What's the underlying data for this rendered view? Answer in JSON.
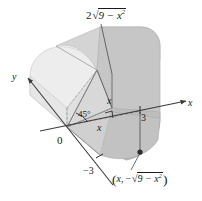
{
  "figure": {
    "kind": "calculus-solid-diagram",
    "background_color": "#ffffff",
    "ink_color": "#1a1a1a"
  },
  "labels": {
    "top_curve": {
      "name": "height-label",
      "coefficient": "2",
      "radical_prefix": "√",
      "radicand_base": "9 − x",
      "radicand_exponent": "2"
    },
    "point": {
      "name": "base-point-label",
      "open_paren": "(",
      "x_part": "x,",
      "minus": "−",
      "radical_prefix": "√",
      "radicand_base": "9 − x",
      "radicand_exponent": "2",
      "close_paren": ")"
    },
    "y_axis": "y",
    "x_axis": "x",
    "origin": "0",
    "tick_positive": "3",
    "tick_negative": "−3",
    "angle": "45°",
    "cross_section_height": "x",
    "base_distance": "x"
  },
  "colors": {
    "surface_light": "#ededed",
    "surface_mid": "#d9d9d9",
    "surface_dark": "#c6c6c6",
    "surface_darker": "#b8b8b8",
    "axis": "#3a3a3a",
    "edge": "#6e6e6e",
    "dot": "#2b2b2b"
  },
  "geometry": {
    "base_radius": 3,
    "cross_section_shape": "isosceles-right-triangle",
    "angle_degrees": 45
  }
}
